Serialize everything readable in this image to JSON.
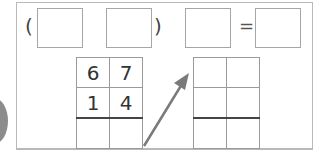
{
  "equation": {
    "open_paren": "(",
    "close_paren": ")",
    "equals": "=",
    "boxes": [
      "",
      "",
      "",
      ""
    ]
  },
  "left_grid": {
    "rows": [
      [
        "6",
        "7"
      ],
      [
        "1",
        "4"
      ],
      [
        "",
        ""
      ]
    ]
  },
  "right_grid": {
    "rows": [
      [
        "",
        ""
      ],
      [
        "",
        ""
      ],
      [
        "",
        ""
      ]
    ]
  },
  "colors": {
    "border": "#a6a6a6",
    "arrow": "#7a7a7a",
    "circle": "#8c8c8c"
  }
}
